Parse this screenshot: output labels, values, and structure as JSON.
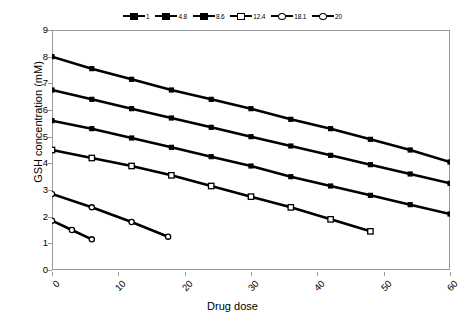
{
  "chart_data": {
    "type": "line",
    "title": "",
    "xlabel": "Drug dose",
    "ylabel": "GSH concentration (mM)",
    "xlim": [
      0,
      60
    ],
    "ylim": [
      0,
      9
    ],
    "xticks": [
      0,
      10,
      20,
      30,
      40,
      50,
      60
    ],
    "yticks": [
      0,
      1,
      2,
      3,
      4,
      5,
      6,
      7,
      8,
      9
    ],
    "grid": false,
    "legend_position": "top-center",
    "legend_entries": [
      "1",
      "4.8",
      "8.6",
      "12.4",
      "18.1",
      "20"
    ],
    "series": [
      {
        "name": "1",
        "marker": "filled-square",
        "x": [
          0,
          6,
          12,
          18,
          24,
          30,
          36,
          42,
          48,
          54,
          60
        ],
        "y": [
          8.0,
          7.55,
          7.15,
          6.75,
          6.4,
          6.05,
          5.65,
          5.3,
          4.9,
          4.5,
          4.05
        ]
      },
      {
        "name": "4.8",
        "marker": "filled-square",
        "x": [
          0,
          6,
          12,
          18,
          24,
          30,
          36,
          42,
          48,
          54,
          60
        ],
        "y": [
          6.75,
          6.4,
          6.05,
          5.7,
          5.35,
          5.0,
          4.65,
          4.3,
          3.95,
          3.6,
          3.25
        ]
      },
      {
        "name": "8.6",
        "marker": "filled-square",
        "x": [
          0,
          6,
          12,
          18,
          24,
          30,
          36,
          42,
          48,
          54,
          60
        ],
        "y": [
          5.6,
          5.3,
          4.95,
          4.6,
          4.25,
          3.9,
          3.5,
          3.15,
          2.8,
          2.45,
          2.1
        ]
      },
      {
        "name": "12.4",
        "marker": "open-square",
        "x": [
          0,
          6,
          12,
          18,
          24,
          30,
          36,
          42,
          48
        ],
        "y": [
          4.5,
          4.2,
          3.9,
          3.55,
          3.15,
          2.75,
          2.35,
          1.9,
          1.45
        ]
      },
      {
        "name": "18.1",
        "marker": "open-circle",
        "x": [
          0,
          6,
          12,
          17.5
        ],
        "y": [
          2.85,
          2.35,
          1.8,
          1.25
        ]
      },
      {
        "name": "20",
        "marker": "open-circle",
        "x": [
          0,
          3,
          6
        ],
        "y": [
          1.85,
          1.5,
          1.15
        ]
      }
    ]
  }
}
